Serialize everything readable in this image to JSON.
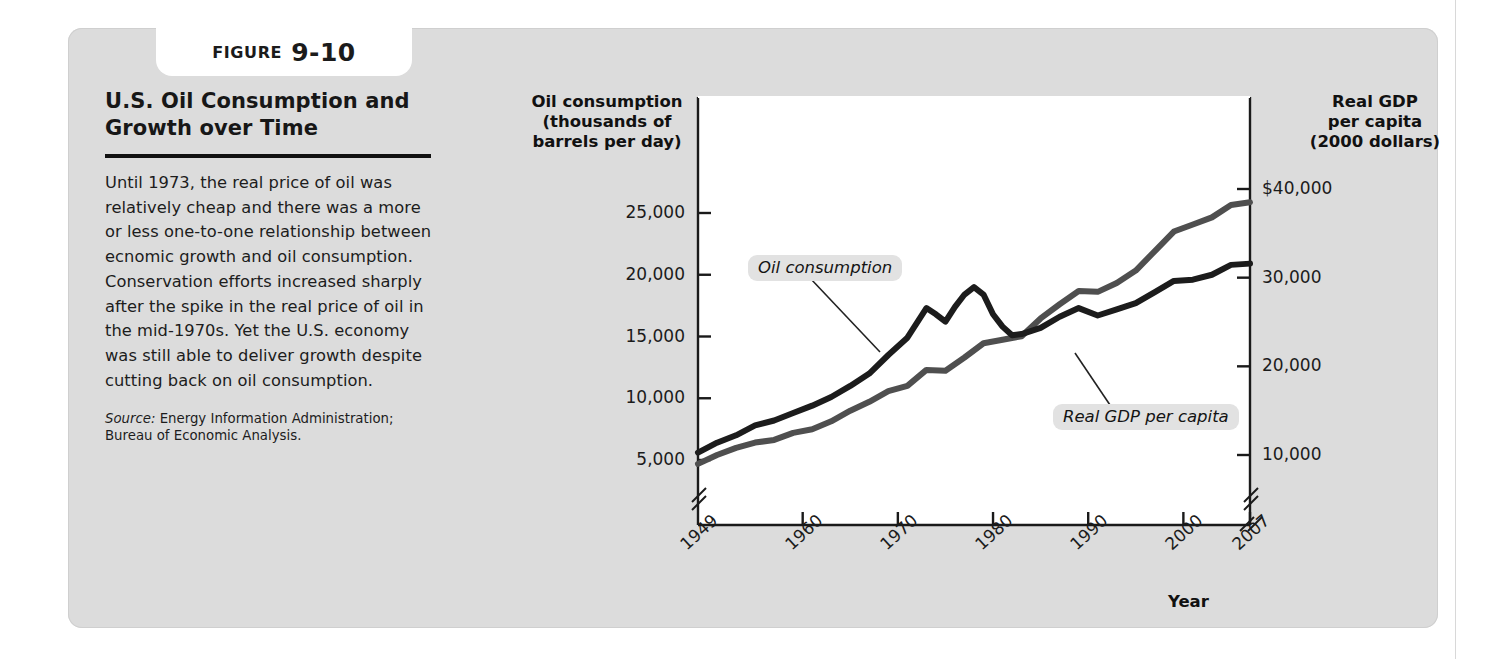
{
  "figure": {
    "tab_word": "Figure",
    "tab_number": "9-10",
    "title": "U.S. Oil Consumption and Growth over Time",
    "body": "Until 1973, the real price of oil was relatively cheap and there was a more or less one-to-one relationship between ecnomic growth and oil consumption. Conservation efforts increased sharply after the spike in the real price of oil in the mid-1970s. Yet the U.S. economy was still able to deliver growth despite cutting back on oil consumption.",
    "source_label": "Source:",
    "source_text": "Energy Information Administration; Bureau of Economic Analysis."
  },
  "chart_data": {
    "type": "line",
    "title": "U.S. Oil Consumption and Growth over Time",
    "xlabel": "Year",
    "ylabel": "Oil consumption (thousands of barrels per day)",
    "y2label": "Real GDP per capita (2000 dollars)",
    "left_axis_title_lines": [
      "Oil consumption",
      "(thousands of",
      "barrels per day)"
    ],
    "right_axis_title_lines": [
      "Real GDP",
      "per capita",
      "(2000 dollars)"
    ],
    "grid": false,
    "legend_position": "inline-annotations",
    "axis_break_left": true,
    "axis_break_right": true,
    "axis_break_x": true,
    "xlim": [
      1949,
      2007
    ],
    "xticks": [
      1949,
      1960,
      1970,
      1980,
      1990,
      2000,
      2007
    ],
    "xticklabels": [
      "1949",
      "1960",
      "1970",
      "1980",
      "1990",
      "2000",
      "2007"
    ],
    "ylim_left": [
      0,
      27500
    ],
    "yticks_left": [
      5000,
      10000,
      15000,
      20000,
      25000
    ],
    "yticklabels_left": [
      "5,000",
      "10,000",
      "15,000",
      "20,000",
      "25,000"
    ],
    "ylim_right": [
      0,
      44000
    ],
    "yticks_right": [
      10000,
      20000,
      30000,
      40000
    ],
    "yticklabels_right": [
      "10,000",
      "20,000",
      "30,000",
      "$40,000"
    ],
    "annotations": [
      {
        "text": "Oil consumption",
        "series": "oil_consumption"
      },
      {
        "text": "Real GDP",
        "series": "real_gdp"
      }
    ],
    "series": [
      {
        "name": "Oil consumption",
        "axis": "left",
        "units": "thousands of barrels per day",
        "color": "#1c1c1c",
        "x": [
          1949,
          1951,
          1953,
          1955,
          1957,
          1959,
          1961,
          1963,
          1965,
          1967,
          1969,
          1971,
          1973,
          1974,
          1975,
          1976,
          1977,
          1978,
          1979,
          1980,
          1981,
          1982,
          1983,
          1985,
          1987,
          1989,
          1991,
          1993,
          1995,
          1997,
          1999,
          2001,
          2003,
          2005,
          2007
        ],
        "values": [
          5600,
          6400,
          7000,
          7800,
          8200,
          8800,
          9400,
          10100,
          11000,
          12000,
          13500,
          14900,
          17300,
          16800,
          16200,
          17400,
          18400,
          19000,
          18400,
          16800,
          15800,
          15100,
          15200,
          15700,
          16600,
          17300,
          16700,
          17200,
          17700,
          18600,
          19500,
          19600,
          20000,
          20800,
          20900
        ]
      },
      {
        "name": "Real GDP per capita",
        "axis": "right",
        "units": "2000 dollars",
        "color": "#4f4f4f",
        "x": [
          1949,
          1951,
          1953,
          1955,
          1957,
          1959,
          1961,
          1963,
          1965,
          1967,
          1969,
          1971,
          1973,
          1975,
          1977,
          1979,
          1981,
          1983,
          1985,
          1987,
          1989,
          1991,
          1993,
          1995,
          1997,
          1999,
          2001,
          2003,
          2005,
          2007
        ],
        "values": [
          9000,
          10000,
          10800,
          11400,
          11700,
          12500,
          12900,
          13800,
          15000,
          16000,
          17200,
          17800,
          19600,
          19500,
          21000,
          22600,
          23000,
          23400,
          25400,
          27000,
          28500,
          28400,
          29400,
          30800,
          33000,
          35200,
          36000,
          36800,
          38200,
          38500
        ]
      }
    ]
  }
}
